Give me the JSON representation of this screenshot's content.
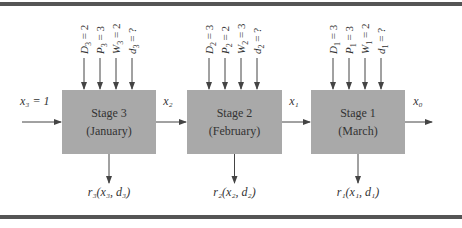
{
  "stages": [
    {
      "label": "Stage 3",
      "month": "(January)",
      "inputs": [
        {
          "v": "D",
          "s": "3",
          "val": "2"
        },
        {
          "v": "P",
          "s": "3",
          "val": "3"
        },
        {
          "v": "W",
          "s": "3",
          "val": "2"
        },
        {
          "v": "d",
          "s": "3",
          "val": "?"
        }
      ],
      "ret": "r₃(x₃, d₃)"
    },
    {
      "label": "Stage 2",
      "month": "(February)",
      "inputs": [
        {
          "v": "D",
          "s": "2",
          "val": "3"
        },
        {
          "v": "P",
          "s": "2",
          "val": "2"
        },
        {
          "v": "W",
          "s": "2",
          "val": "3"
        },
        {
          "v": "d",
          "s": "2",
          "val": "?"
        }
      ],
      "ret": "r₂(x₂, d₂)"
    },
    {
      "label": "Stage 1",
      "month": "(March)",
      "inputs": [
        {
          "v": "D",
          "s": "1",
          "val": "3"
        },
        {
          "v": "P",
          "s": "1",
          "val": "3"
        },
        {
          "v": "W",
          "s": "1",
          "val": "2"
        },
        {
          "v": "d",
          "s": "1",
          "val": "?"
        }
      ],
      "ret": "r₁(x₁, d₁)"
    }
  ],
  "flows": [
    "x₃ = 1",
    "x₂",
    "x₁",
    "x₀"
  ],
  "colors": {
    "box": "#a9a9a9",
    "line": "#444444",
    "rule": "#555555"
  }
}
